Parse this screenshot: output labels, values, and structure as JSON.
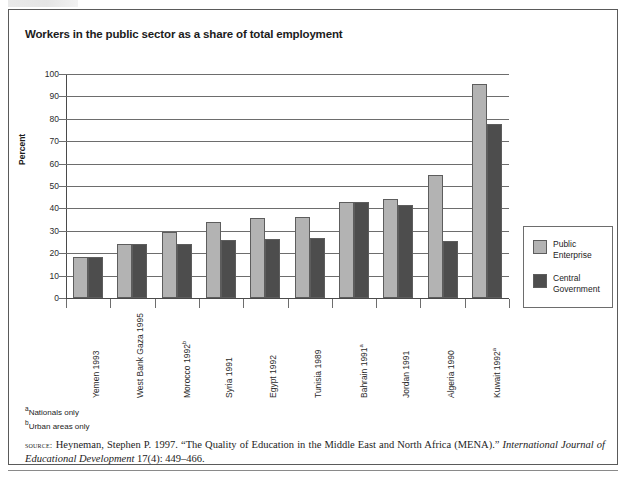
{
  "figure": {
    "title": "Workers in the public sector as a share of total employment"
  },
  "chart_data": {
    "type": "bar",
    "title": "Workers in the public sector as a share of total employment",
    "xlabel": "",
    "ylabel": "Percent",
    "ylim": [
      0,
      100
    ],
    "ytick_step": 10,
    "yticks": [
      "100",
      "90",
      "80",
      "70",
      "60",
      "50",
      "40",
      "30",
      "20",
      "10",
      "0"
    ],
    "grid": true,
    "legend_position": "right",
    "categories": [
      "Yemen 1993",
      "West Bank Gaza 1995",
      "Morocco 1992b",
      "Syria 1991",
      "Egypt 1992",
      "Tunisia 1989",
      "Bahrain 1991a",
      "Jordan 1991",
      "Algeria 1990",
      "Kuwait 1992a"
    ],
    "category_labels": [
      {
        "text": "Yemen 1993",
        "footnote": ""
      },
      {
        "text": "West Bank Gaza 1995",
        "footnote": ""
      },
      {
        "text": "Morocco 1992",
        "footnote": "b"
      },
      {
        "text": "Syria 1991",
        "footnote": ""
      },
      {
        "text": "Egypt 1992",
        "footnote": ""
      },
      {
        "text": "Tunisia 1989",
        "footnote": ""
      },
      {
        "text": "Bahrain 1991",
        "footnote": "a"
      },
      {
        "text": "Jordan 1991",
        "footnote": ""
      },
      {
        "text": "Algeria 1990",
        "footnote": ""
      },
      {
        "text": "Kuwait 1992",
        "footnote": "a"
      }
    ],
    "series": [
      {
        "name": "Public Enterprise",
        "legend_label": "Public\nEnterprise",
        "color": "#b3b3b3",
        "values": [
          18.5,
          24,
          29.5,
          34,
          35.5,
          36,
          43,
          44,
          55,
          95.5
        ]
      },
      {
        "name": "Central Government",
        "legend_label": "Central\nGovernment",
        "color": "#4d4d4d",
        "values": [
          18.5,
          24,
          24,
          26,
          26.5,
          27,
          43,
          41.5,
          25.5,
          77.5
        ]
      }
    ]
  },
  "footnotes": [
    {
      "marker": "a",
      "text": "Nationals only"
    },
    {
      "marker": "b",
      "text": "Urban areas only"
    }
  ],
  "source": {
    "label": "source:",
    "text_part1": " Heyneman, Stephen P. 1997. “The Quality of Education in the Middle East and North Africa (MENA).” ",
    "italic_part": "International Journal of Educational Development",
    "text_part2": " 17(4): 449–466."
  }
}
